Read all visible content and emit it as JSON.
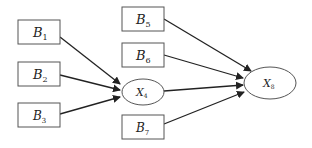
{
  "diagram": {
    "type": "path-diagram",
    "nodes": [
      {
        "id": "B1",
        "shape": "rect",
        "main": "B",
        "sub": "1",
        "x": 18,
        "y": 20,
        "w": 42,
        "h": 24
      },
      {
        "id": "B2",
        "shape": "rect",
        "main": "B",
        "sub": "2",
        "x": 18,
        "y": 62,
        "w": 42,
        "h": 24
      },
      {
        "id": "B3",
        "shape": "rect",
        "main": "B",
        "sub": "3",
        "x": 18,
        "y": 103,
        "w": 42,
        "h": 24
      },
      {
        "id": "B5",
        "shape": "rect",
        "main": "B",
        "sub": "5",
        "x": 122,
        "y": 7,
        "w": 42,
        "h": 24
      },
      {
        "id": "B6",
        "shape": "rect",
        "main": "B",
        "sub": "6",
        "x": 122,
        "y": 43,
        "w": 42,
        "h": 24
      },
      {
        "id": "X4",
        "shape": "ellipse",
        "main": "X",
        "sub": "4",
        "cx": 143,
        "cy": 92,
        "rx": 21,
        "ry": 13
      },
      {
        "id": "B7",
        "shape": "rect",
        "main": "B",
        "sub": "7",
        "x": 122,
        "y": 115,
        "w": 42,
        "h": 24
      },
      {
        "id": "X8",
        "shape": "ellipse",
        "main": "X",
        "sub": "8",
        "cx": 270,
        "cy": 83,
        "rx": 26,
        "ry": 16
      }
    ],
    "edges": [
      {
        "from": "B1",
        "to": "X4"
      },
      {
        "from": "B2",
        "to": "X4"
      },
      {
        "from": "B3",
        "to": "X4"
      },
      {
        "from": "B5",
        "to": "X8"
      },
      {
        "from": "B6",
        "to": "X8"
      },
      {
        "from": "X4",
        "to": "X8"
      },
      {
        "from": "B7",
        "to": "X8"
      }
    ]
  }
}
